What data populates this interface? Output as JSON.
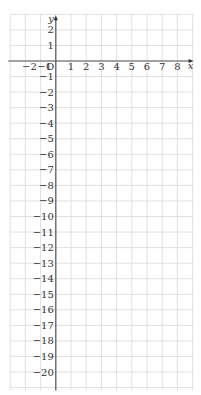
{
  "diagram": {
    "type": "coordinate-grid",
    "grid": {
      "x_min": -3,
      "x_max": 9,
      "y_min": -21,
      "y_max": 3,
      "grid_color": "#d9d9d9",
      "axis_color": "#555555"
    },
    "origin_label": "O",
    "x_axis_label": "x",
    "y_axis_label": "y",
    "x_ticks": [
      {
        "value": -2,
        "label": "−2"
      },
      {
        "value": -1,
        "label": "−1"
      },
      {
        "value": 1,
        "label": "1"
      },
      {
        "value": 2,
        "label": "2"
      },
      {
        "value": 3,
        "label": "3"
      },
      {
        "value": 4,
        "label": "4"
      },
      {
        "value": 5,
        "label": "5"
      },
      {
        "value": 6,
        "label": "6"
      },
      {
        "value": 7,
        "label": "7"
      },
      {
        "value": 8,
        "label": "8"
      }
    ],
    "y_ticks": [
      {
        "value": 2,
        "label": "2"
      },
      {
        "value": 1,
        "label": "1"
      },
      {
        "value": -1,
        "label": "−1"
      },
      {
        "value": -2,
        "label": "−2"
      },
      {
        "value": -3,
        "label": "−3"
      },
      {
        "value": -4,
        "label": "−4"
      },
      {
        "value": -5,
        "label": "−5"
      },
      {
        "value": -6,
        "label": "−6"
      },
      {
        "value": -7,
        "label": "−7"
      },
      {
        "value": -8,
        "label": "−8"
      },
      {
        "value": -9,
        "label": "−9"
      },
      {
        "value": -10,
        "label": "−10"
      },
      {
        "value": -11,
        "label": "−11"
      },
      {
        "value": -12,
        "label": "−12"
      },
      {
        "value": -13,
        "label": "−13"
      },
      {
        "value": -14,
        "label": "−14"
      },
      {
        "value": -15,
        "label": "−15"
      },
      {
        "value": -16,
        "label": "−16"
      },
      {
        "value": -17,
        "label": "−17"
      },
      {
        "value": -18,
        "label": "−18"
      },
      {
        "value": -19,
        "label": "−19"
      },
      {
        "value": -20,
        "label": "−20"
      }
    ]
  }
}
